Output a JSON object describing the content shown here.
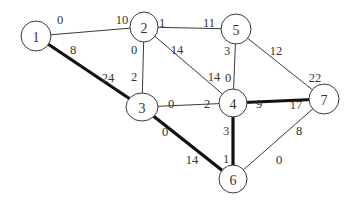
{
  "diagram": {
    "type": "weighted-graph",
    "nodes": [
      {
        "id": "1",
        "label": "1",
        "x": 36,
        "y": 36,
        "rx": 15,
        "ry": 15
      },
      {
        "id": "2",
        "label": "2",
        "x": 144,
        "y": 27,
        "rx": 14,
        "ry": 15
      },
      {
        "id": "5",
        "label": "5",
        "x": 236,
        "y": 29,
        "rx": 15,
        "ry": 15
      },
      {
        "id": "3",
        "label": "3",
        "x": 142,
        "y": 107,
        "rx": 16,
        "ry": 14
      },
      {
        "id": "4",
        "label": "4",
        "x": 233,
        "y": 103,
        "rx": 14,
        "ry": 14
      },
      {
        "id": "7",
        "label": "7",
        "x": 324,
        "y": 99,
        "rx": 15,
        "ry": 15
      },
      {
        "id": "6",
        "label": "6",
        "x": 233,
        "y": 179,
        "rx": 14,
        "ry": 14
      }
    ],
    "edges": [
      {
        "from": "1",
        "to": "2",
        "thick": false,
        "label_from": "0",
        "label_to": "10",
        "lf": [
          60,
          20
        ],
        "lt": [
          122,
          20
        ]
      },
      {
        "from": "1",
        "to": "3",
        "thick": true,
        "label_from": "8",
        "label_to": "24",
        "lf": [
          73,
          50
        ],
        "lt": [
          108,
          78
        ]
      },
      {
        "from": "2",
        "to": "5",
        "thick": false,
        "label_from": "1",
        "label_to": "11",
        "lf": [
          162,
          23
        ],
        "lt": [
          209,
          23
        ]
      },
      {
        "from": "2",
        "to": "3",
        "thick": false,
        "label_from": "0",
        "label_to": "2",
        "lf": [
          134,
          50
        ],
        "lt": [
          134,
          77
        ]
      },
      {
        "from": "2",
        "to": "4",
        "thick": false,
        "label_from": "14",
        "label_to": "14",
        "lf": [
          177,
          50
        ],
        "lt": [
          214,
          77
        ]
      },
      {
        "from": "5",
        "to": "4",
        "thick": false,
        "label_from": "3",
        "label_to": "0",
        "lf": [
          227,
          51
        ],
        "lt": [
          228,
          78
        ]
      },
      {
        "from": "5",
        "to": "7",
        "thick": false,
        "label_from": "12",
        "label_to": "22",
        "lf": [
          276,
          51
        ],
        "lt": [
          315,
          78
        ]
      },
      {
        "from": "3",
        "to": "4",
        "thick": false,
        "label_from": "0",
        "label_to": "2",
        "lf": [
          171,
          104
        ],
        "lt": [
          207,
          104
        ]
      },
      {
        "from": "4",
        "to": "7",
        "thick": true,
        "label_from": "9",
        "label_to": "17",
        "lf": [
          259,
          104
        ],
        "lt": [
          296,
          105
        ]
      },
      {
        "from": "3",
        "to": "6",
        "thick": true,
        "label_from": "0",
        "label_to": "14",
        "lf": [
          165,
          132
        ],
        "lt": [
          192,
          160
        ]
      },
      {
        "from": "4",
        "to": "6",
        "thick": true,
        "label_from": "3",
        "label_to": "1",
        "lf": [
          226,
          131
        ],
        "lt": [
          226,
          159
        ]
      },
      {
        "from": "6",
        "to": "7",
        "thick": false,
        "label_from": "0",
        "label_to": "8",
        "lf": [
          279,
          160
        ],
        "lt": [
          299,
          131
        ]
      }
    ]
  }
}
